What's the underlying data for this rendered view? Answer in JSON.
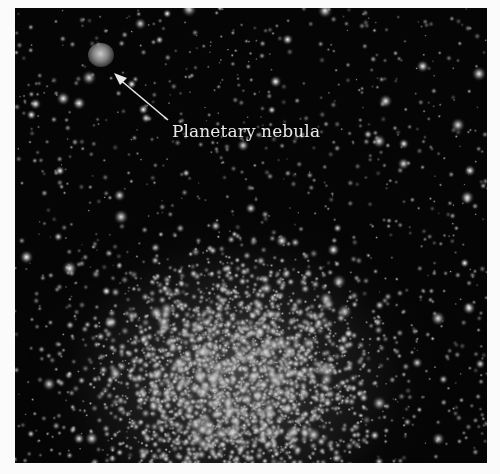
{
  "figure": {
    "background_color": "#050505",
    "page_color": "#fbfbfb",
    "annotation": {
      "label": "Planetary nebula",
      "label_color": "#e8e8e8",
      "arrow_color": "#e8e8e8",
      "target": "planetary-nebula"
    }
  }
}
